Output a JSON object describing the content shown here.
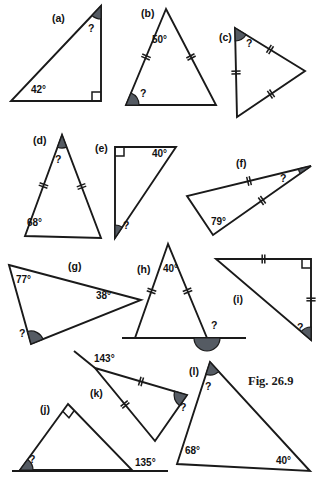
{
  "figure": {
    "caption": "Fig. 26.9",
    "unknown_marker": "?",
    "degree_symbol": "°"
  },
  "chart_data": {
    "type": "diagram",
    "title": "Fig. 26.9",
    "items": [
      {
        "id": "a",
        "label": "(a)",
        "label_x": 52,
        "label_y": 22,
        "vertices": [
          [
            11,
            101
          ],
          [
            101,
            101
          ],
          [
            101,
            6
          ]
        ],
        "angles": [
          {
            "text": "42°",
            "x": 31,
            "y": 93,
            "vertex": 0,
            "shaded": false
          },
          {
            "text": "?",
            "x": 88,
            "y": 32,
            "vertex": 2,
            "shaded": true
          }
        ],
        "right_angle": {
          "vertex": 1
        },
        "ticks": []
      },
      {
        "id": "b",
        "label": "(b)",
        "label_x": 141,
        "label_y": 17,
        "vertices": [
          [
            166,
            9
          ],
          [
            126,
            105
          ],
          [
            216,
            105
          ]
        ],
        "angles": [
          {
            "text": "50°",
            "x": 152,
            "y": 43,
            "vertex": 0,
            "shaded": false
          },
          {
            "text": "?",
            "x": 140,
            "y": 97,
            "vertex": 1,
            "shaded": true
          }
        ],
        "right_angle": null,
        "ticks": [
          {
            "edge": [
              0,
              1
            ],
            "count": 2
          },
          {
            "edge": [
              0,
              2
            ],
            "count": 2
          }
        ]
      },
      {
        "id": "c",
        "label": "(c)",
        "label_x": 219,
        "label_y": 41,
        "vertices": [
          [
            235,
            28
          ],
          [
            305,
            71
          ],
          [
            237,
            117
          ]
        ],
        "angles": [
          {
            "text": "?",
            "x": 246,
            "y": 47,
            "vertex": 0,
            "shaded": true
          }
        ],
        "right_angle": null,
        "ticks": [
          {
            "edge": [
              0,
              1
            ],
            "count": 2
          },
          {
            "edge": [
              1,
              2
            ],
            "count": 2
          },
          {
            "edge": [
              2,
              0
            ],
            "count": 2
          }
        ]
      },
      {
        "id": "d",
        "label": "(d)",
        "label_x": 33,
        "label_y": 144,
        "vertices": [
          [
            62,
            135
          ],
          [
            25,
            236
          ],
          [
            101,
            238
          ]
        ],
        "angles": [
          {
            "text": "68°",
            "x": 27,
            "y": 226,
            "vertex": 1,
            "shaded": false
          },
          {
            "text": "?",
            "x": 55,
            "y": 163,
            "vertex": 0,
            "shaded": true
          }
        ],
        "right_angle": null,
        "ticks": [
          {
            "edge": [
              0,
              1
            ],
            "count": 2
          },
          {
            "edge": [
              0,
              2
            ],
            "count": 2
          }
        ]
      },
      {
        "id": "e",
        "label": "(e)",
        "label_x": 95,
        "label_y": 152,
        "vertices": [
          [
            115,
            147
          ],
          [
            176,
            147
          ],
          [
            115,
            238
          ]
        ],
        "angles": [
          {
            "text": "40°",
            "x": 152,
            "y": 157,
            "vertex": 1,
            "shaded": false
          },
          {
            "text": "?",
            "x": 123,
            "y": 229,
            "vertex": 2,
            "shaded": true
          }
        ],
        "right_angle": {
          "vertex": 0
        },
        "ticks": []
      },
      {
        "id": "f",
        "label": "(f)",
        "label_x": 236,
        "label_y": 167,
        "vertices": [
          [
            311,
            166
          ],
          [
            187,
            196
          ],
          [
            213,
            235
          ]
        ],
        "angles": [
          {
            "text": "79°",
            "x": 211,
            "y": 225,
            "vertex": 2,
            "shaded": false
          },
          {
            "text": "?",
            "x": 280,
            "y": 182,
            "vertex": 0,
            "shaded": true
          }
        ],
        "right_angle": null,
        "ticks": [
          {
            "edge": [
              0,
              1
            ],
            "count": 2
          },
          {
            "edge": [
              0,
              2
            ],
            "count": 2
          }
        ]
      },
      {
        "id": "g",
        "label": "(g)",
        "label_x": 68,
        "label_y": 270,
        "vertices": [
          [
            9,
            265
          ],
          [
            141,
            300
          ],
          [
            31,
            344
          ]
        ],
        "angles": [
          {
            "text": "77°",
            "x": 16,
            "y": 283,
            "vertex": 0,
            "shaded": false
          },
          {
            "text": "38°",
            "x": 96,
            "y": 299,
            "vertex": 1,
            "shaded": false
          },
          {
            "text": "?",
            "x": 19,
            "y": 337,
            "vertex": 2,
            "shaded": true
          }
        ],
        "right_angle": null,
        "ticks": []
      },
      {
        "id": "h",
        "label": "(h)",
        "label_x": 137,
        "label_y": 273,
        "vertices": [
          [
            168,
            244
          ],
          [
            135,
            338
          ],
          [
            207,
            338
          ]
        ],
        "angles": [
          {
            "text": "40°",
            "x": 163,
            "y": 272,
            "vertex": 0,
            "shaded": false
          },
          {
            "text": "?",
            "x": 211,
            "y": 329,
            "vertex": 2,
            "shaded": true,
            "exterior": true
          }
        ],
        "baseline": {
          "from": [
            122,
            338
          ],
          "to": [
            246,
            338
          ]
        },
        "right_angle": null,
        "ticks": [
          {
            "edge": [
              0,
              1
            ],
            "count": 2
          },
          {
            "edge": [
              0,
              2
            ],
            "count": 2
          }
        ]
      },
      {
        "id": "i",
        "label": "(i)",
        "label_x": 233,
        "label_y": 303,
        "vertices": [
          [
            216,
            259
          ],
          [
            311,
            259
          ],
          [
            311,
            340
          ]
        ],
        "angles": [
          {
            "text": "?",
            "x": 297,
            "y": 331,
            "vertex": 2,
            "shaded": true
          }
        ],
        "right_angle": {
          "vertex": 1
        },
        "ticks": [
          {
            "edge": [
              0,
              1
            ],
            "count": 2
          },
          {
            "edge": [
              1,
              2
            ],
            "count": 2
          }
        ]
      },
      {
        "id": "j",
        "label": "(j)",
        "label_x": 40,
        "label_y": 413,
        "vertices": [
          [
            68,
            404
          ],
          [
            20,
            470
          ],
          [
            132,
            470
          ]
        ],
        "angles": [
          {
            "text": "?",
            "x": 29,
            "y": 463,
            "vertex": 1,
            "shaded": true
          },
          {
            "text": "135°",
            "x": 135,
            "y": 466,
            "vertex": 2,
            "shaded": false,
            "exterior": true
          }
        ],
        "baseline": {
          "from": [
            12,
            471
          ],
          "to": [
            168,
            471
          ]
        },
        "right_angle": {
          "vertex": 0
        },
        "ticks": []
      },
      {
        "id": "k",
        "label": "(k)",
        "label_x": 90,
        "label_y": 397,
        "vertices": [
          [
            95,
            368
          ],
          [
            187,
            395
          ],
          [
            155,
            441
          ]
        ],
        "angles": [
          {
            "text": "143°",
            "x": 94,
            "y": 362,
            "vertex": 0,
            "shaded": false,
            "exterior": true
          },
          {
            "text": "?",
            "x": 180,
            "y": 411,
            "vertex": 1,
            "shaded": true
          }
        ],
        "extension": {
          "from": [
            95,
            368
          ],
          "to": [
            74,
            351
          ]
        },
        "right_angle": null,
        "ticks": [
          {
            "edge": [
              0,
              1
            ],
            "count": 2
          },
          {
            "edge": [
              0,
              2
            ],
            "count": 2
          }
        ]
      },
      {
        "id": "l",
        "label": "(l)",
        "label_x": 189,
        "label_y": 375,
        "vertices": [
          [
            210,
            362
          ],
          [
            177,
            464
          ],
          [
            310,
            471
          ]
        ],
        "angles": [
          {
            "text": "?",
            "x": 205,
            "y": 390,
            "vertex": 0,
            "shaded": true
          },
          {
            "text": "68°",
            "x": 185,
            "y": 454,
            "vertex": 1,
            "shaded": false
          },
          {
            "text": "40°",
            "x": 276,
            "y": 464,
            "vertex": 2,
            "shaded": false
          }
        ],
        "right_angle": null,
        "ticks": []
      }
    ]
  }
}
